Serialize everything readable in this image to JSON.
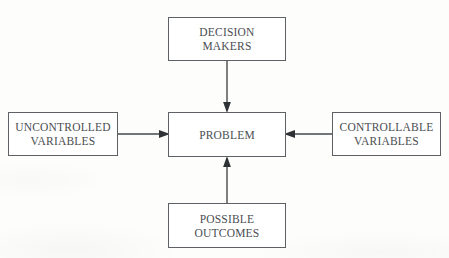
{
  "document": {
    "title_fragment": "",
    "background_color": "#fdfdfc",
    "ink_color": "#4a4d51",
    "border_color": "#5d6064"
  },
  "diagram": {
    "type": "flowchart",
    "center_node_id": "problem",
    "nodes": [
      {
        "id": "decision-makers",
        "label": "DECISION\nMAKERS",
        "position": "top"
      },
      {
        "id": "uncontrolled-variables",
        "label": "UNCONTROLLED\nVARIABLES",
        "position": "left"
      },
      {
        "id": "problem",
        "label": "PROBLEM",
        "position": "center"
      },
      {
        "id": "controllable-variables",
        "label": "CONTROLLABLE\nVARIABLES",
        "position": "right"
      },
      {
        "id": "possible-outcomes",
        "label": "POSSIBLE\nOUTCOMES",
        "position": "bottom"
      }
    ],
    "connectors": [
      {
        "id": "decision-to-problem",
        "from": "decision-makers",
        "to": "problem",
        "direction": "down",
        "arrowhead": "at-target"
      },
      {
        "id": "uncontrolled-to-problem",
        "from": "uncontrolled-variables",
        "to": "problem",
        "direction": "right",
        "arrowhead": "at-target"
      },
      {
        "id": "controllable-to-problem",
        "from": "controllable-variables",
        "to": "problem",
        "direction": "left",
        "arrowhead": "at-target"
      },
      {
        "id": "outcomes-to-problem",
        "from": "possible-outcomes",
        "to": "problem",
        "direction": "up",
        "arrowhead": "at-target"
      }
    ]
  }
}
